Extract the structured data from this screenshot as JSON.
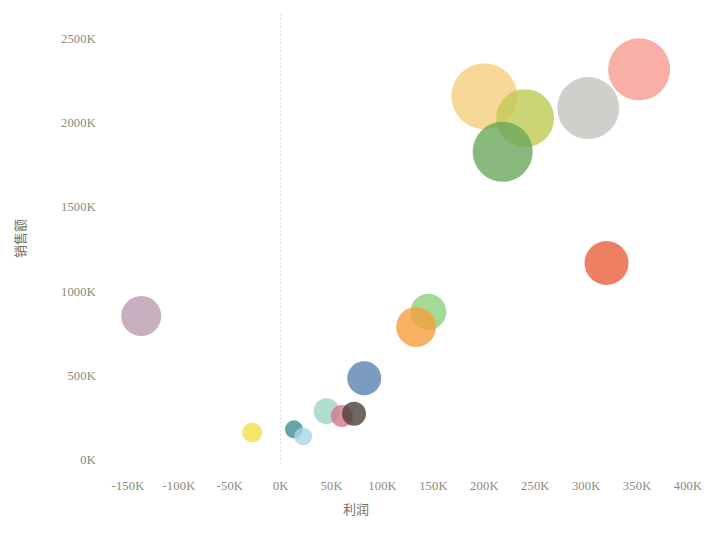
{
  "chart_data": {
    "type": "scatter",
    "title": "",
    "subtitle": "",
    "xlabel": "利润",
    "ylabel": "销售额",
    "xlim": [
      -175000,
      412000
    ],
    "ylim": [
      -30000,
      2620000
    ],
    "grid": false,
    "legend": null,
    "reference_lines": [
      {
        "axis": "x",
        "value": 0,
        "style": "dotted",
        "color": "#d8d2c4"
      }
    ],
    "xticks": [
      {
        "value": -150000,
        "label": "-150K"
      },
      {
        "value": -100000,
        "label": "-100K"
      },
      {
        "value": -50000,
        "label": "-50K"
      },
      {
        "value": 0,
        "label": "0K"
      },
      {
        "value": 50000,
        "label": "50K"
      },
      {
        "value": 100000,
        "label": "100K"
      },
      {
        "value": 150000,
        "label": "150K"
      },
      {
        "value": 200000,
        "label": "200K"
      },
      {
        "value": 250000,
        "label": "250K"
      },
      {
        "value": 300000,
        "label": "300K"
      },
      {
        "value": 350000,
        "label": "350K"
      },
      {
        "value": 400000,
        "label": "400K"
      }
    ],
    "yticks": [
      {
        "value": 0,
        "label": "0K"
      },
      {
        "value": 500000,
        "label": "500K"
      },
      {
        "value": 1000000,
        "label": "1000K"
      },
      {
        "value": 1500000,
        "label": "1500K"
      },
      {
        "value": 2000000,
        "label": "2000K"
      },
      {
        "value": 2500000,
        "label": "2500K"
      }
    ],
    "size_encoding": "bubble area",
    "points": [
      {
        "x": 352000,
        "y": 2320000,
        "r": 31,
        "color": "#f79b8e",
        "name": "bubble-salmon"
      },
      {
        "x": 302000,
        "y": 2090000,
        "r": 31,
        "color": "#c4c3be",
        "name": "bubble-gray"
      },
      {
        "x": 200000,
        "y": 2160000,
        "r": 33,
        "color": "#f5ce80",
        "name": "bubble-tan"
      },
      {
        "x": 240000,
        "y": 2030000,
        "r": 29,
        "color": "#bfcb52",
        "name": "bubble-olive"
      },
      {
        "x": 218000,
        "y": 1830000,
        "r": 30,
        "color": "#6aa65a",
        "name": "bubble-green"
      },
      {
        "x": 320000,
        "y": 1170000,
        "r": 22,
        "color": "#e8603c",
        "name": "bubble-tomato"
      },
      {
        "x": -137000,
        "y": 855000,
        "r": 20,
        "color": "#b99bb0",
        "name": "bubble-mauve"
      },
      {
        "x": 145000,
        "y": 880000,
        "r": 18,
        "color": "#8cd17d",
        "name": "bubble-lightgreen"
      },
      {
        "x": 133000,
        "y": 790000,
        "r": 20,
        "color": "#f5a03c",
        "name": "bubble-orange"
      },
      {
        "x": 82000,
        "y": 485000,
        "r": 17,
        "color": "#5a82b0",
        "name": "bubble-blue"
      },
      {
        "x": 45000,
        "y": 290000,
        "r": 13,
        "color": "#9dd4c4",
        "name": "bubble-mint"
      },
      {
        "x": 60000,
        "y": 262000,
        "r": 11,
        "color": "#d4778a",
        "name": "bubble-rose"
      },
      {
        "x": 72000,
        "y": 275000,
        "r": 12,
        "color": "#4a4038",
        "name": "bubble-darkbrown"
      },
      {
        "x": 13000,
        "y": 182000,
        "r": 9,
        "color": "#3f8f90",
        "name": "bubble-teal"
      },
      {
        "x": 22000,
        "y": 140000,
        "r": 9,
        "color": "#a8d5e8",
        "name": "bubble-paleblue"
      },
      {
        "x": -28000,
        "y": 163000,
        "r": 10,
        "color": "#f5e04a",
        "name": "bubble-yellow"
      }
    ]
  }
}
